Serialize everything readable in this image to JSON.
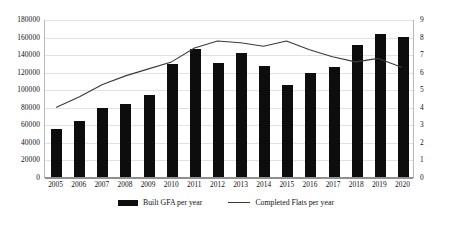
{
  "chart_data": {
    "type": "bar",
    "title": "",
    "subtitle": "",
    "xlabel": "",
    "ylabel": "",
    "y2label": "",
    "grid": true,
    "legend_position": "bottom",
    "categories": [
      "2005",
      "2006",
      "2007",
      "2008",
      "2009",
      "2010",
      "2011",
      "2012",
      "2013",
      "2014",
      "2015",
      "2016",
      "2017",
      "2018",
      "2019",
      "2020"
    ],
    "ylim": [
      0,
      180000
    ],
    "yticks": [
      0,
      20000,
      40000,
      60000,
      80000,
      100000,
      120000,
      140000,
      160000,
      180000
    ],
    "ytick_labels": [
      "0",
      "20000",
      "40000",
      "60000",
      "80000",
      "100000",
      "120000",
      "140000",
      "160000",
      "180000"
    ],
    "y2lim": [
      0,
      9
    ],
    "y2ticks": [
      0,
      1,
      2,
      3,
      4,
      5,
      6,
      7,
      8,
      9
    ],
    "y2tick_labels": [
      "0",
      "1",
      "2",
      "3",
      "4",
      "5",
      "6",
      "7",
      "8",
      "9"
    ],
    "series": [
      {
        "name": "Built GFA per year",
        "type": "bar",
        "axis": "left",
        "color": "#0d0d0d",
        "values": [
          55000,
          64000,
          79000,
          83000,
          93000,
          129000,
          146000,
          130000,
          141000,
          126000,
          105000,
          118000,
          125000,
          150000,
          163000,
          159000
        ]
      },
      {
        "name": "Completed Flats per year",
        "type": "line",
        "axis": "right",
        "color": "#3a3a3a",
        "values": [
          4.0,
          4.6,
          5.3,
          5.8,
          6.2,
          6.6,
          7.4,
          7.8,
          7.7,
          7.5,
          7.8,
          7.3,
          6.9,
          6.6,
          6.8,
          6.3
        ]
      }
    ]
  },
  "legend": {
    "items": [
      {
        "label": "Built GFA per year",
        "marker": "bar-swatch"
      },
      {
        "label": "Completed Flats per year",
        "marker": "line-swatch"
      }
    ]
  },
  "colors": {
    "bar": "#0d0d0d",
    "line": "#3a3a3a",
    "grid": "#e2e2e2",
    "axis": "#8f8f8f",
    "background": "#ffffff"
  }
}
